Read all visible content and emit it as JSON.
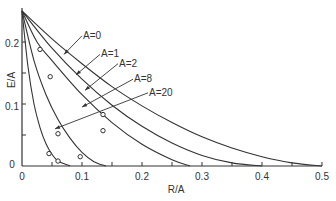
{
  "chart_data": {
    "type": "line",
    "title": "",
    "xlabel": "R/A",
    "ylabel": "E/A",
    "xlim": [
      0,
      0.5
    ],
    "ylim": [
      0,
      0.25
    ],
    "grid": false,
    "x_ticks": [
      "0",
      "0.1",
      "0.2",
      "0.3",
      "0.4",
      "0.5"
    ],
    "x_minor_ticks": [
      0.05,
      0.15,
      0.25,
      0.35,
      0.45
    ],
    "y_ticks": [
      "0",
      "0.1",
      "0.2"
    ],
    "y_minor_ticks": [
      0.05,
      0.15
    ],
    "series": [
      {
        "name": "A=0",
        "x": [
          0,
          0.05,
          0.1,
          0.15,
          0.2,
          0.25,
          0.3,
          0.35,
          0.4,
          0.45,
          0.5
        ],
        "y": [
          0.25,
          0.205,
          0.165,
          0.128,
          0.097,
          0.07,
          0.047,
          0.029,
          0.015,
          0.005,
          0.0
        ]
      },
      {
        "name": "A=1",
        "x": [
          0,
          0.05,
          0.1,
          0.15,
          0.2,
          0.25,
          0.3,
          0.35,
          0.4
        ],
        "y": [
          0.25,
          0.19,
          0.14,
          0.098,
          0.064,
          0.037,
          0.017,
          0.005,
          0.0
        ]
      },
      {
        "name": "A=2",
        "x": [
          0,
          0.025,
          0.05,
          0.1,
          0.15,
          0.2,
          0.25,
          0.28
        ],
        "y": [
          0.25,
          0.2,
          0.17,
          0.115,
          0.07,
          0.035,
          0.01,
          0.0
        ]
      },
      {
        "name": "A=8",
        "x": [
          0,
          0.02,
          0.04,
          0.06,
          0.08,
          0.1,
          0.12,
          0.14
        ],
        "y": [
          0.25,
          0.17,
          0.115,
          0.075,
          0.045,
          0.022,
          0.007,
          0.0
        ]
      },
      {
        "name": "A=20",
        "x": [
          0,
          0.01,
          0.02,
          0.03,
          0.04,
          0.05,
          0.06,
          0.08
        ],
        "y": [
          0.25,
          0.16,
          0.1,
          0.062,
          0.036,
          0.019,
          0.008,
          0.0
        ]
      }
    ],
    "markers": [
      {
        "series": "A=0",
        "points": [
          [
            0.03,
            0.188
          ]
        ]
      },
      {
        "series": "A=1",
        "points": [
          [
            0.047,
            0.144
          ]
        ]
      },
      {
        "series": "A=2",
        "points": [
          [
            0.135,
            0.083
          ],
          [
            0.135,
            0.057
          ]
        ]
      },
      {
        "series": "A=8",
        "points": [
          [
            0.06,
            0.052
          ],
          [
            0.097,
            0.015
          ]
        ]
      },
      {
        "series": "A=20",
        "points": [
          [
            0.045,
            0.02
          ],
          [
            0.06,
            0.008
          ]
        ]
      }
    ],
    "annotations": [
      {
        "text": "A=0",
        "label_pos": [
          0.1,
          0.21
        ],
        "arrow_to": [
          0.07,
          0.18
        ]
      },
      {
        "text": "A=1",
        "label_pos": [
          0.13,
          0.18
        ],
        "arrow_to": [
          0.09,
          0.147
        ]
      },
      {
        "text": "A=2",
        "label_pos": [
          0.16,
          0.165
        ],
        "arrow_to": [
          0.105,
          0.122
        ]
      },
      {
        "text": "A=8",
        "label_pos": [
          0.185,
          0.14
        ],
        "arrow_to": [
          0.1,
          0.095
        ]
      },
      {
        "text": "A=20",
        "label_pos": [
          0.21,
          0.118
        ],
        "arrow_to": [
          0.055,
          0.06
        ]
      }
    ]
  },
  "axes": {
    "x_label": "R/A",
    "y_label": "E/A",
    "x_tick_labels": [
      "0",
      "0.1",
      "0.2",
      "0.3",
      "0.4",
      "0.5"
    ],
    "y_tick_labels": [
      "0",
      "0.1",
      "0.2"
    ]
  },
  "annotation_labels": [
    "A=0",
    "A=1",
    "A=2",
    "A=8",
    "A=20"
  ]
}
